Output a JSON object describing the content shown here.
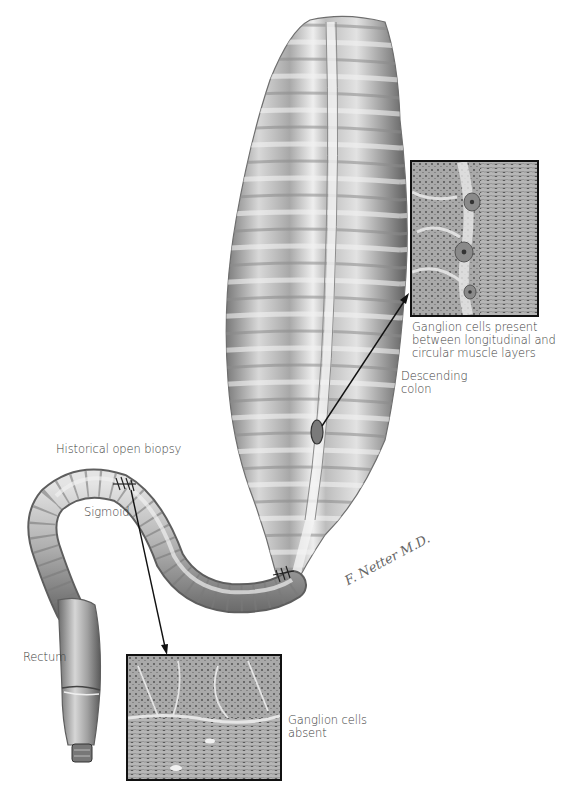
{
  "figure": {
    "labels": {
      "ganglion_present_line1": "Ganglion cells present",
      "ganglion_present_line2": "between longitudinal and",
      "ganglion_present_line3": "circular muscle layers",
      "descending_line1": "Descending",
      "descending_line2": "colon",
      "historical_biopsy": "Historical open biopsy",
      "sigmoid": "Sigmoid",
      "rectum": "Rectum",
      "ganglion_absent_line1": "Ganglion cells",
      "ganglion_absent_line2": "absent"
    },
    "signature": "F. Netter M.D.",
    "insets": [
      {
        "name": "histology-ganglion-present",
        "x": 410,
        "y": 160,
        "w": 129,
        "h": 157
      },
      {
        "name": "histology-ganglion-absent",
        "x": 126,
        "y": 654,
        "w": 156,
        "h": 127
      }
    ],
    "colors": {
      "tissue_dark": "#6e6e6e",
      "tissue_light": "#e6e6e6",
      "border": "#111111",
      "text": "#3c3c3c"
    }
  }
}
